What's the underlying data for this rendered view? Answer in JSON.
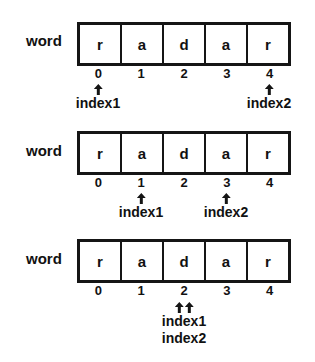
{
  "diagram": {
    "variable_name": "word",
    "cells": [
      "r",
      "a",
      "d",
      "a",
      "r"
    ],
    "indices": [
      "0",
      "1",
      "2",
      "3",
      "4"
    ],
    "panels": [
      {
        "pointers": [
          {
            "label": "index1",
            "at": 0
          },
          {
            "label": "index2",
            "at": 4
          }
        ]
      },
      {
        "pointers": [
          {
            "label": "index1",
            "at": 1
          },
          {
            "label": "index2",
            "at": 3
          }
        ]
      },
      {
        "pointers": [
          {
            "labels": [
              "index1",
              "index2"
            ],
            "at": 2
          }
        ]
      }
    ]
  },
  "labels": {
    "word": "word",
    "c0": "r",
    "c1": "a",
    "c2": "d",
    "c3": "a",
    "c4": "r",
    "i0": "0",
    "i1": "1",
    "i2": "2",
    "i3": "3",
    "i4": "4",
    "index1": "index1",
    "index2": "index2"
  },
  "colors": {
    "ink": "#151515",
    "background": "#ffffff"
  }
}
